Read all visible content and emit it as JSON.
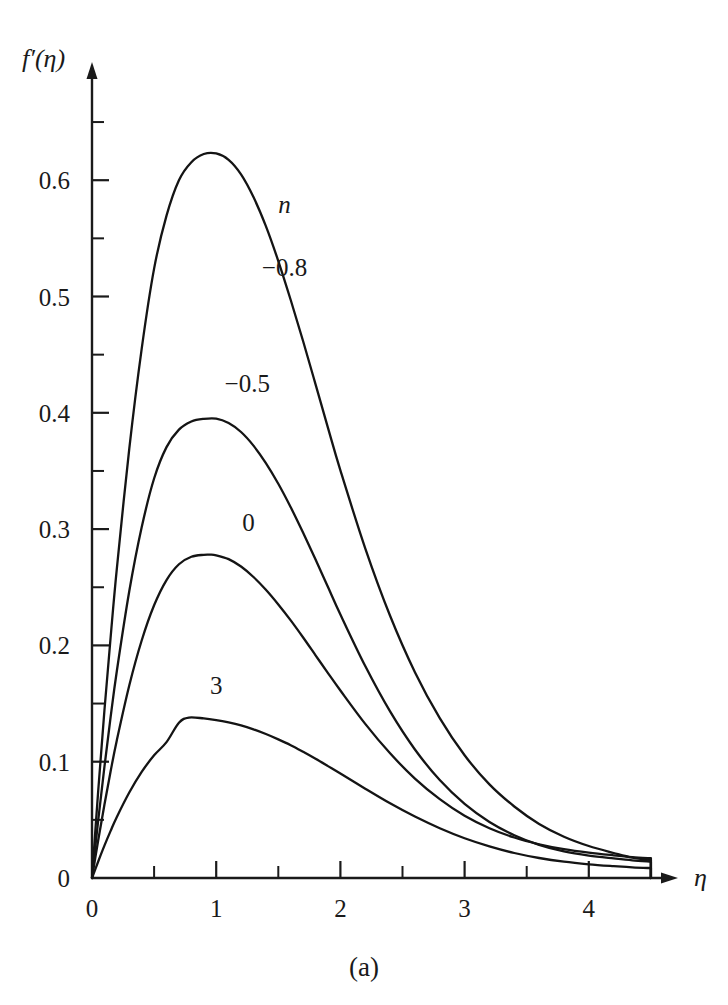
{
  "figure": {
    "caption": "(a)"
  },
  "chart_data": {
    "type": "line",
    "title": "",
    "subtitle": "",
    "xlabel": "η",
    "ylabel": "f′(η)",
    "xlim": [
      0,
      4.7
    ],
    "ylim": [
      0,
      0.67
    ],
    "grid": false,
    "legend_position": "inline-annotations",
    "legend_title": "n",
    "x_ticks_major": [
      0,
      1,
      2,
      3,
      4
    ],
    "x_tick_labels": [
      "0",
      "1",
      "2",
      "3",
      "4"
    ],
    "x_ticks_minor": [
      0.5,
      1.5,
      2.5,
      3.5,
      4.5
    ],
    "y_ticks_major": [
      0,
      0.1,
      0.2,
      0.3,
      0.4,
      0.5,
      0.6
    ],
    "y_tick_labels": [
      "0",
      "0.1",
      "0.2",
      "0.3",
      "0.4",
      "0.5",
      "0.6"
    ],
    "y_ticks_minor": [
      0.05,
      0.15,
      0.25,
      0.35,
      0.45,
      0.55,
      0.65
    ],
    "annotations": [
      {
        "text": "n",
        "x": 1.55,
        "y": 0.572,
        "italic": true
      },
      {
        "text": "−0.8",
        "x": 1.55,
        "y": 0.518,
        "italic": false
      },
      {
        "text": "−0.5",
        "x": 1.25,
        "y": 0.418,
        "italic": false
      },
      {
        "text": "0",
        "x": 1.26,
        "y": 0.298,
        "italic": false
      },
      {
        "text": "3",
        "x": 1.0,
        "y": 0.158,
        "italic": false
      }
    ],
    "series": [
      {
        "name": "-0.8",
        "label": "−0.8",
        "peak": {
          "x": 1.0,
          "y": 0.623
        },
        "points": [
          [
            0.0,
            0.0
          ],
          [
            0.05,
            0.075
          ],
          [
            0.1,
            0.144
          ],
          [
            0.15,
            0.207
          ],
          [
            0.2,
            0.266
          ],
          [
            0.3,
            0.369
          ],
          [
            0.4,
            0.455
          ],
          [
            0.5,
            0.524
          ],
          [
            0.6,
            0.5695
          ],
          [
            0.7,
            0.6
          ],
          [
            0.8,
            0.6155
          ],
          [
            0.9,
            0.6225
          ],
          [
            1.0,
            0.623
          ],
          [
            1.1,
            0.6175
          ],
          [
            1.2,
            0.605
          ],
          [
            1.3,
            0.5855
          ],
          [
            1.4,
            0.5605
          ],
          [
            1.5,
            0.5305
          ],
          [
            1.6,
            0.497
          ],
          [
            1.7,
            0.4615
          ],
          [
            1.8,
            0.4245
          ],
          [
            1.9,
            0.387
          ],
          [
            2.0,
            0.3505
          ],
          [
            2.2,
            0.2835
          ],
          [
            2.4,
            0.2255
          ],
          [
            2.6,
            0.177
          ],
          [
            2.8,
            0.1375
          ],
          [
            3.0,
            0.1055
          ],
          [
            3.2,
            0.0805
          ],
          [
            3.4,
            0.0615
          ],
          [
            3.6,
            0.0465
          ],
          [
            3.8,
            0.0355
          ],
          [
            4.0,
            0.0275
          ],
          [
            4.2,
            0.0215
          ],
          [
            4.35,
            0.0175
          ],
          [
            4.5,
            0.0155
          ]
        ]
      },
      {
        "name": "-0.5",
        "label": "−0.5",
        "peak": {
          "x": 1.0,
          "y": 0.395
        },
        "points": [
          [
            0.0,
            0.0
          ],
          [
            0.05,
            0.0495
          ],
          [
            0.1,
            0.0955
          ],
          [
            0.15,
            0.1385
          ],
          [
            0.2,
            0.178
          ],
          [
            0.3,
            0.2465
          ],
          [
            0.4,
            0.3015
          ],
          [
            0.5,
            0.3435
          ],
          [
            0.6,
            0.3705
          ],
          [
            0.7,
            0.3855
          ],
          [
            0.8,
            0.3925
          ],
          [
            0.9,
            0.3948
          ],
          [
            1.0,
            0.395
          ],
          [
            1.1,
            0.3912
          ],
          [
            1.2,
            0.3835
          ],
          [
            1.3,
            0.3718
          ],
          [
            1.4,
            0.3568
          ],
          [
            1.5,
            0.339
          ],
          [
            1.6,
            0.3188
          ],
          [
            1.7,
            0.2968
          ],
          [
            1.8,
            0.2738
          ],
          [
            1.9,
            0.2502
          ],
          [
            2.0,
            0.2265
          ],
          [
            2.2,
            0.1822
          ],
          [
            2.4,
            0.1432
          ],
          [
            2.6,
            0.1105
          ],
          [
            2.8,
            0.0842
          ],
          [
            3.0,
            0.0637
          ],
          [
            3.2,
            0.0482
          ],
          [
            3.4,
            0.0368
          ],
          [
            3.6,
            0.0285
          ],
          [
            3.8,
            0.0228
          ],
          [
            4.0,
            0.0192
          ],
          [
            4.2,
            0.0168
          ],
          [
            4.35,
            0.0152
          ],
          [
            4.5,
            0.0142
          ]
        ]
      },
      {
        "name": "0",
        "label": "0",
        "peak": {
          "x": 0.95,
          "y": 0.278
        },
        "points": [
          [
            0.0,
            0.0
          ],
          [
            0.05,
            0.0325
          ],
          [
            0.1,
            0.063
          ],
          [
            0.15,
            0.0918
          ],
          [
            0.2,
            0.1185
          ],
          [
            0.3,
            0.1655
          ],
          [
            0.4,
            0.2042
          ],
          [
            0.5,
            0.2345
          ],
          [
            0.6,
            0.2562
          ],
          [
            0.7,
            0.2698
          ],
          [
            0.8,
            0.2762
          ],
          [
            0.9,
            0.2779
          ],
          [
            0.95,
            0.278
          ],
          [
            1.0,
            0.2775
          ],
          [
            1.1,
            0.2742
          ],
          [
            1.2,
            0.2678
          ],
          [
            1.3,
            0.2588
          ],
          [
            1.4,
            0.2478
          ],
          [
            1.5,
            0.2352
          ],
          [
            1.6,
            0.2215
          ],
          [
            1.7,
            0.2068
          ],
          [
            1.8,
            0.1915
          ],
          [
            1.9,
            0.1762
          ],
          [
            2.0,
            0.1612
          ],
          [
            2.2,
            0.1325
          ],
          [
            2.4,
            0.1072
          ],
          [
            2.6,
            0.0855
          ],
          [
            2.8,
            0.0678
          ],
          [
            3.0,
            0.0535
          ],
          [
            3.2,
            0.0428
          ],
          [
            3.4,
            0.0348
          ],
          [
            3.6,
            0.029
          ],
          [
            3.8,
            0.0248
          ],
          [
            4.0,
            0.0218
          ],
          [
            4.2,
            0.0195
          ],
          [
            4.35,
            0.018
          ],
          [
            4.5,
            0.017
          ]
        ]
      },
      {
        "name": "3",
        "label": "3",
        "peak": {
          "x": 0.78,
          "y": 0.138
        },
        "points": [
          [
            0.0,
            0.0
          ],
          [
            0.05,
            0.0142
          ],
          [
            0.1,
            0.0278
          ],
          [
            0.15,
            0.0405
          ],
          [
            0.2,
            0.0525
          ],
          [
            0.3,
            0.0735
          ],
          [
            0.4,
            0.0912
          ],
          [
            0.5,
            0.1055
          ],
          [
            0.6,
            0.1168
          ],
          [
            0.7,
            0.1335
          ],
          [
            0.78,
            0.138
          ],
          [
            0.9,
            0.1372
          ],
          [
            1.0,
            0.1358
          ],
          [
            1.1,
            0.1338
          ],
          [
            1.2,
            0.1312
          ],
          [
            1.3,
            0.1278
          ],
          [
            1.4,
            0.1238
          ],
          [
            1.5,
            0.1192
          ],
          [
            1.6,
            0.1142
          ],
          [
            1.7,
            0.1085
          ],
          [
            1.8,
            0.1025
          ],
          [
            1.9,
            0.0962
          ],
          [
            2.0,
            0.0898
          ],
          [
            2.2,
            0.0768
          ],
          [
            2.4,
            0.0642
          ],
          [
            2.6,
            0.0528
          ],
          [
            2.8,
            0.0428
          ],
          [
            3.0,
            0.0342
          ],
          [
            3.2,
            0.0272
          ],
          [
            3.4,
            0.0215
          ],
          [
            3.6,
            0.0172
          ],
          [
            3.8,
            0.014
          ],
          [
            4.0,
            0.0118
          ],
          [
            4.2,
            0.0102
          ],
          [
            4.35,
            0.0092
          ],
          [
            4.5,
            0.0085
          ]
        ]
      }
    ]
  }
}
